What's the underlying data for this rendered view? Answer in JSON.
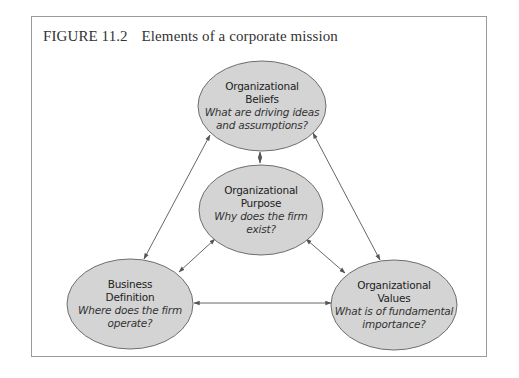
{
  "figure": {
    "number": "FIGURE 11.2",
    "caption": "Elements of a corporate mission"
  },
  "colors": {
    "ellipse_fill": "#d4d4d4",
    "ellipse_stroke": "#6e6e6e",
    "arrow": "#555555",
    "frame": "#9a9a9a"
  },
  "nodes": [
    {
      "id": "beliefs",
      "name_line1": "Organizational",
      "name_line2": "Beliefs",
      "question_line1": "What are driving ideas",
      "question_line2": "and assumptions?"
    },
    {
      "id": "purpose",
      "name_line1": "Organizational",
      "name_line2": "Purpose",
      "question_line1": "Why does the firm",
      "question_line2": "exist?"
    },
    {
      "id": "business",
      "name_line1": "Business",
      "name_line2": "Definition",
      "question_line1": "Where does the firm",
      "question_line2": "operate?"
    },
    {
      "id": "values",
      "name_line1": "Organizational",
      "name_line2": "Values",
      "question_line1": "What is of fundamental",
      "question_line2": "importance?"
    }
  ],
  "edges": [
    {
      "from": "beliefs",
      "to": "purpose",
      "type": "bidirectional"
    },
    {
      "from": "beliefs",
      "to": "business",
      "type": "bidirectional"
    },
    {
      "from": "beliefs",
      "to": "values",
      "type": "bidirectional"
    },
    {
      "from": "purpose",
      "to": "business",
      "type": "bidirectional"
    },
    {
      "from": "purpose",
      "to": "values",
      "type": "bidirectional"
    },
    {
      "from": "business",
      "to": "values",
      "type": "bidirectional"
    }
  ]
}
